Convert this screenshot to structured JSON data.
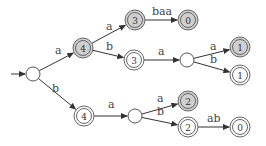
{
  "diagram": {
    "type": "trie-automaton",
    "colors": {
      "shaded": "#cfcfcf",
      "stroke": "#555555",
      "edge": "#333333"
    },
    "nodes": [
      {
        "id": "root",
        "label": "",
        "x": 33,
        "y": 74,
        "kind": "plain",
        "start": true
      },
      {
        "id": "n4a",
        "label": "4",
        "x": 83,
        "y": 48,
        "kind": "shaded"
      },
      {
        "id": "n3a",
        "label": "3",
        "x": 135,
        "y": 20,
        "kind": "shaded"
      },
      {
        "id": "n0a",
        "label": "0",
        "x": 188,
        "y": 20,
        "kind": "shaded"
      },
      {
        "id": "n3b",
        "label": "3",
        "x": 134,
        "y": 60,
        "kind": "double"
      },
      {
        "id": "m1",
        "label": "",
        "x": 187,
        "y": 60,
        "kind": "plain"
      },
      {
        "id": "n1a",
        "label": "1",
        "x": 240,
        "y": 47,
        "kind": "shaded"
      },
      {
        "id": "n1b",
        "label": "1",
        "x": 240,
        "y": 75,
        "kind": "double"
      },
      {
        "id": "n4b",
        "label": "4",
        "x": 84,
        "y": 116,
        "kind": "double"
      },
      {
        "id": "m2",
        "label": "",
        "x": 135,
        "y": 116,
        "kind": "plain"
      },
      {
        "id": "n2a",
        "label": "2",
        "x": 188,
        "y": 101,
        "kind": "shaded"
      },
      {
        "id": "n2b",
        "label": "2",
        "x": 188,
        "y": 127,
        "kind": "double"
      },
      {
        "id": "n0b",
        "label": "0",
        "x": 240,
        "y": 127,
        "kind": "double"
      }
    ],
    "edges": [
      {
        "from": "root",
        "to": "n4a",
        "label": "a",
        "lx": 55,
        "ly": 54
      },
      {
        "from": "root",
        "to": "n4b",
        "label": "b",
        "lx": 52,
        "ly": 92
      },
      {
        "from": "n4a",
        "to": "n3a",
        "label": "a",
        "lx": 106,
        "ly": 30
      },
      {
        "from": "n4a",
        "to": "n3b",
        "label": "b",
        "lx": 106,
        "ly": 50
      },
      {
        "from": "n3a",
        "to": "n0a",
        "label": "baa",
        "lx": 152,
        "ly": 15
      },
      {
        "from": "n3b",
        "to": "m1",
        "label": "a",
        "lx": 158,
        "ly": 55
      },
      {
        "from": "m1",
        "to": "n1a",
        "label": "a",
        "lx": 210,
        "ly": 50
      },
      {
        "from": "m1",
        "to": "n1b",
        "label": "b",
        "lx": 210,
        "ly": 63
      },
      {
        "from": "n4b",
        "to": "m2",
        "label": "a",
        "lx": 108,
        "ly": 108
      },
      {
        "from": "m2",
        "to": "n2a",
        "label": "a",
        "lx": 157,
        "ly": 102
      },
      {
        "from": "m2",
        "to": "n2b",
        "label": "b",
        "lx": 157,
        "ly": 115
      },
      {
        "from": "n2b",
        "to": "n0b",
        "label": "ab",
        "lx": 207,
        "ly": 122
      }
    ]
  }
}
